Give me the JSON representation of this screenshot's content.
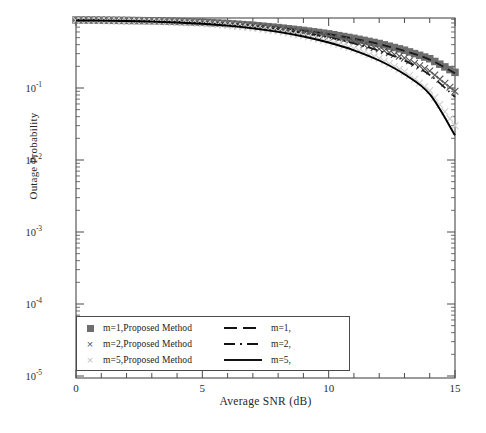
{
  "chart_data": {
    "type": "line",
    "title": "",
    "xlabel": "Average SNR (dB)",
    "ylabel": "Outage Probability",
    "xlim": [
      0,
      15
    ],
    "ylim": [
      1e-05,
      1
    ],
    "yscale": "log",
    "xscale": "linear",
    "grid": false,
    "legend_position": "lower left (inside axes)",
    "x_major_ticks": [
      "0",
      "5",
      "10",
      "15"
    ],
    "x_minor_tick_step": 1,
    "y_major_ticks": [
      "10-1",
      "10-2",
      "10-3",
      "10-4",
      "10-5"
    ],
    "y_tick_exponents": [
      -1,
      -2,
      -3,
      -4,
      -5
    ],
    "x": [
      0,
      1,
      2,
      3,
      4,
      5,
      6,
      7,
      8,
      9,
      10,
      11,
      12,
      13,
      14,
      15
    ],
    "series": [
      {
        "name": "m=1,Proposed Method",
        "marker": "filled-square",
        "marker_color": "#6e6e6e",
        "style": "markers",
        "values": [
          0.88,
          0.875,
          0.868,
          0.857,
          0.842,
          0.818,
          0.785,
          0.742,
          0.69,
          0.63,
          0.565,
          0.49,
          0.415,
          0.335,
          0.255,
          0.165
        ]
      },
      {
        "name": "m=1,",
        "marker": "none",
        "line_color": "#1a1a1a",
        "style": "dashed",
        "values": [
          0.878,
          0.873,
          0.866,
          0.855,
          0.84,
          0.816,
          0.783,
          0.74,
          0.687,
          0.627,
          0.56,
          0.485,
          0.408,
          0.328,
          0.248,
          0.16
        ]
      },
      {
        "name": "m=2,Proposed Method",
        "marker": "x",
        "marker_color": "#555555",
        "style": "markers",
        "values": [
          0.875,
          0.87,
          0.862,
          0.85,
          0.833,
          0.806,
          0.77,
          0.722,
          0.663,
          0.596,
          0.52,
          0.435,
          0.348,
          0.26,
          0.172,
          0.09
        ]
      },
      {
        "name": "m=2,",
        "marker": "none",
        "line_color": "#1a1a1a",
        "style": "dash-dot",
        "values": [
          0.872,
          0.867,
          0.859,
          0.846,
          0.828,
          0.8,
          0.762,
          0.712,
          0.651,
          0.582,
          0.504,
          0.417,
          0.328,
          0.24,
          0.152,
          0.075
        ]
      },
      {
        "name": "m=5,Proposed Method",
        "marker": "x",
        "marker_color": "#d0d0d0",
        "style": "markers",
        "values": [
          0.87,
          0.864,
          0.854,
          0.84,
          0.818,
          0.786,
          0.742,
          0.684,
          0.614,
          0.533,
          0.444,
          0.35,
          0.256,
          0.168,
          0.092,
          0.03
        ]
      },
      {
        "name": "m=5,",
        "marker": "none",
        "line_color": "#000000",
        "style": "solid",
        "values": [
          0.868,
          0.862,
          0.852,
          0.836,
          0.813,
          0.78,
          0.734,
          0.674,
          0.602,
          0.519,
          0.428,
          0.334,
          0.241,
          0.155,
          0.082,
          0.022
        ]
      }
    ]
  },
  "axes": {
    "ylabel": "Outage Probability",
    "xlabel": "Average SNR (dB)",
    "xticklabels": [
      "0",
      "5",
      "10",
      "15"
    ],
    "yticks": [
      {
        "mantissa": "10",
        "exponent": "-1"
      },
      {
        "mantissa": "10",
        "exponent": "-2"
      },
      {
        "mantissa": "10",
        "exponent": "-3"
      },
      {
        "mantissa": "10",
        "exponent": "-4"
      },
      {
        "mantissa": "10",
        "exponent": "-5"
      }
    ]
  },
  "legend": {
    "rows": [
      {
        "marker": "filled-square",
        "proposed_label": "m=1,Proposed Method",
        "line_style": "dashed",
        "analytic_label": "m=1,"
      },
      {
        "marker": "x",
        "proposed_label": "m=2,Proposed Method",
        "line_style": "dash-dot",
        "analytic_label": "m=2,"
      },
      {
        "marker": "x-faint",
        "proposed_label": "m=5,Proposed Method",
        "line_style": "solid",
        "analytic_label": "m=5,"
      }
    ]
  },
  "colors": {
    "axis": "#3a3a3a",
    "marker_dark": "#6e6e6e",
    "marker_mid": "#555555",
    "marker_light": "#d0d0d0",
    "line": "#121212"
  }
}
